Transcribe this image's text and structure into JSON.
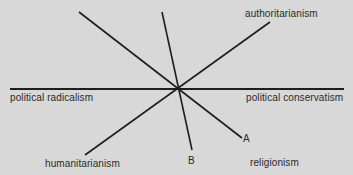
{
  "diagram": {
    "background": "#d8d8d8",
    "line_color": "#1e1e1e",
    "center": [
      178,
      89
    ],
    "axes": [
      {
        "name": "horizontal",
        "from": [
          10,
          89
        ],
        "to": [
          344,
          89
        ],
        "width": 2
      },
      {
        "name": "upper-left-to-A",
        "from": [
          79,
          12
        ],
        "to": [
          242,
          138
        ],
        "width": 1.6
      },
      {
        "name": "steep-to-B",
        "from": [
          162,
          12
        ],
        "to": [
          192,
          150
        ],
        "width": 1.6
      },
      {
        "name": "authoritarian-humanitarian",
        "from": [
          270,
          22
        ],
        "to": [
          85,
          155
        ],
        "width": 1.6
      }
    ],
    "labels": {
      "authoritarianism": "authoritarianism",
      "political_radicalism": "political  radicalism",
      "political_conservatism": "political  conservatism",
      "humanitarianism": "humanitarianism",
      "B": "B",
      "A": "A",
      "religionism": "religionism"
    }
  }
}
